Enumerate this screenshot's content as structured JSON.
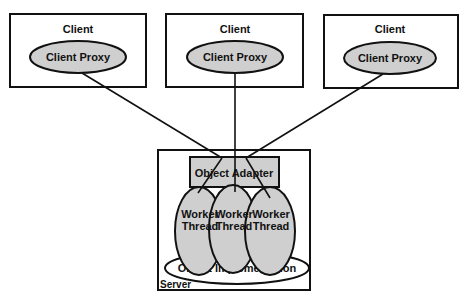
{
  "diagram": {
    "colors": {
      "stroke": "#111111",
      "fill_gray": "#cfcfcf",
      "background": "#ffffff"
    },
    "clients": [
      {
        "title": "Client",
        "proxy_label": "Client Proxy"
      },
      {
        "title": "Client",
        "proxy_label": "Client Proxy"
      },
      {
        "title": "Client",
        "proxy_label": "Client Proxy"
      }
    ],
    "server": {
      "label": "Server",
      "adapter_label": "Object Adapter",
      "workers": [
        {
          "line1": "Worker",
          "line2": "Thread"
        },
        {
          "line1": "Worker",
          "line2": "Thread"
        },
        {
          "line1": "Worker",
          "line2": "Thread"
        }
      ],
      "implementation_label": "Object Implementation"
    }
  }
}
